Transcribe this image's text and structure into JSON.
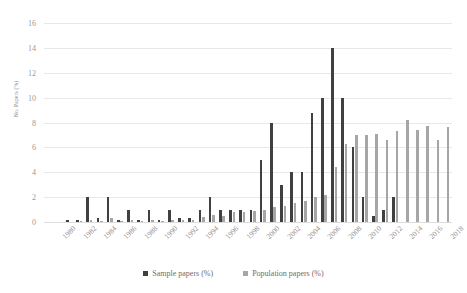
{
  "chart_data": {
    "type": "bar",
    "title": "",
    "xlabel": "",
    "ylabel": "No. Papers (%)",
    "ylim": [
      0,
      16
    ],
    "ytick_step": 2,
    "yticks": [
      0,
      2,
      4,
      6,
      8,
      10,
      12,
      14,
      16
    ],
    "grid": true,
    "legend_position": "bottom",
    "x_tick_labels": [
      "1980",
      "1982",
      "1984",
      "1986",
      "1988",
      "1990",
      "1992",
      "1994",
      "1996",
      "1998",
      "2000",
      "2002",
      "2004",
      "2006",
      "2008",
      "2010",
      "2012",
      "2014",
      "2016",
      "2018"
    ],
    "categories": [
      "1980",
      "1981",
      "1982",
      "1983",
      "1984",
      "1985",
      "1986",
      "1987",
      "1988",
      "1989",
      "1990",
      "1991",
      "1992",
      "1993",
      "1994",
      "1995",
      "1996",
      "1997",
      "1998",
      "1999",
      "2000",
      "2001",
      "2002",
      "2003",
      "2004",
      "2005",
      "2006",
      "2007",
      "2008",
      "2009",
      "2010",
      "2011",
      "2012",
      "2013",
      "2014",
      "2015",
      "2016",
      "2017",
      "2018",
      "2019"
    ],
    "series": [
      {
        "name": "Sample papers (%)",
        "color": "#404040",
        "values": [
          0,
          0,
          0.2,
          0.2,
          2.0,
          0.3,
          2.0,
          0.2,
          1.0,
          0.2,
          1.0,
          0.2,
          1.0,
          0.3,
          0.3,
          1.0,
          2.0,
          1.0,
          1.0,
          1.0,
          1.0,
          5.0,
          8.0,
          3.0,
          4.0,
          4.0,
          8.8,
          10.0,
          14.0,
          10.0,
          6.0,
          2.0,
          0.5,
          1.0,
          2.0,
          0,
          0,
          0,
          0,
          0
        ]
      },
      {
        "name": "Population papers (%)",
        "color": "#a6a6a6",
        "values": [
          0,
          0,
          0,
          0.1,
          0.2,
          0.1,
          0.3,
          0.1,
          0.2,
          0.1,
          0.2,
          0.1,
          0.2,
          0.2,
          0.2,
          0.4,
          0.6,
          0.5,
          0.8,
          0.8,
          0.9,
          1.0,
          1.2,
          1.3,
          1.5,
          1.7,
          2.0,
          2.2,
          4.4,
          6.3,
          7.0,
          7.0,
          7.1,
          6.6,
          7.3,
          8.2,
          7.4,
          7.7,
          6.6,
          7.6
        ]
      }
    ]
  },
  "legend": {
    "items": [
      {
        "label": "Sample papers (%)",
        "color": "#404040"
      },
      {
        "label": "Population papers (%)",
        "color": "#a6a6a6"
      }
    ]
  }
}
